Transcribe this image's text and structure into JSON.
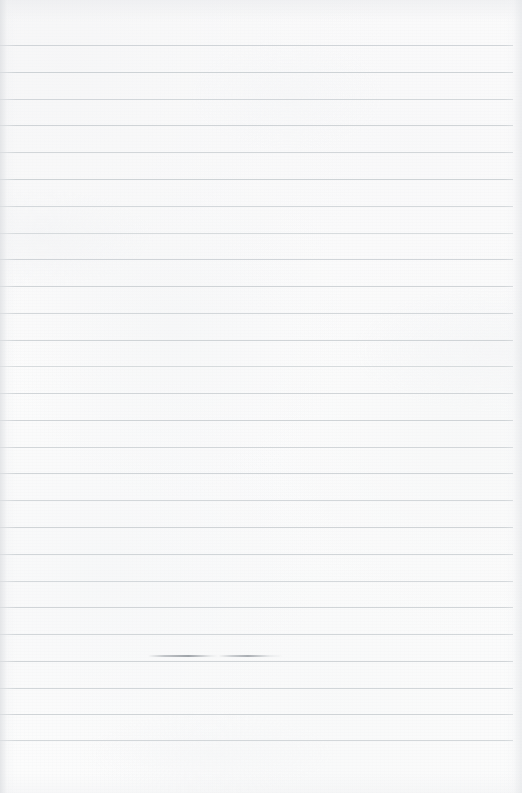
{
  "document": {
    "kind": "scanned-ruled-notebook-page",
    "page_width": 522,
    "page_height": 793,
    "background_color": "#fcfcfc",
    "text_content": "",
    "handwriting_present": false
  },
  "ruling": {
    "line_color": "#c9ced2",
    "line_thickness": 1,
    "line_count": 26,
    "first_line_y": 45,
    "line_spacing": 26.8,
    "line_start_x": 0,
    "line_end_x": 513,
    "top_margin": 45,
    "bottom_margin": 53,
    "vertical_margin_rule": false,
    "lines": [
      {
        "y": 45,
        "x1": 0,
        "x2": 513,
        "opacity": 0.85
      },
      {
        "y": 72,
        "x1": 0,
        "x2": 513,
        "opacity": 0.9
      },
      {
        "y": 99,
        "x1": 0,
        "x2": 513,
        "opacity": 0.8
      },
      {
        "y": 125,
        "x1": 0,
        "x2": 513,
        "opacity": 0.88
      },
      {
        "y": 152,
        "x1": 0,
        "x2": 513,
        "opacity": 0.82
      },
      {
        "y": 179,
        "x1": 0,
        "x2": 513,
        "opacity": 0.9
      },
      {
        "y": 206,
        "x1": 0,
        "x2": 513,
        "opacity": 0.78
      },
      {
        "y": 233,
        "x1": 0,
        "x2": 513,
        "opacity": 0.7
      },
      {
        "y": 259,
        "x1": 0,
        "x2": 513,
        "opacity": 0.85
      },
      {
        "y": 286,
        "x1": 0,
        "x2": 513,
        "opacity": 0.88
      },
      {
        "y": 313,
        "x1": 0,
        "x2": 513,
        "opacity": 0.8
      },
      {
        "y": 340,
        "x1": 0,
        "x2": 513,
        "opacity": 0.86
      },
      {
        "y": 366,
        "x1": 0,
        "x2": 513,
        "opacity": 0.7
      },
      {
        "y": 393,
        "x1": 0,
        "x2": 513,
        "opacity": 0.84
      },
      {
        "y": 420,
        "x1": 0,
        "x2": 513,
        "opacity": 0.88
      },
      {
        "y": 447,
        "x1": 0,
        "x2": 513,
        "opacity": 0.82
      },
      {
        "y": 473,
        "x1": 0,
        "x2": 513,
        "opacity": 0.86
      },
      {
        "y": 500,
        "x1": 0,
        "x2": 513,
        "opacity": 0.8
      },
      {
        "y": 527,
        "x1": 0,
        "x2": 513,
        "opacity": 0.88
      },
      {
        "y": 554,
        "x1": 0,
        "x2": 513,
        "opacity": 0.84
      },
      {
        "y": 581,
        "x1": 0,
        "x2": 513,
        "opacity": 0.78
      },
      {
        "y": 607,
        "x1": 0,
        "x2": 513,
        "opacity": 0.86
      },
      {
        "y": 634,
        "x1": 0,
        "x2": 513,
        "opacity": 0.82
      },
      {
        "y": 661,
        "x1": 0,
        "x2": 513,
        "opacity": 0.88
      },
      {
        "y": 688,
        "x1": 0,
        "x2": 513,
        "opacity": 0.84
      },
      {
        "y": 714,
        "x1": 0,
        "x2": 513,
        "opacity": 0.86
      },
      {
        "y": 740,
        "x1": 0,
        "x2": 513,
        "opacity": 0.8
      }
    ]
  },
  "artifacts": {
    "smudge": {
      "description": "darker pen-trace smudge along a ruled line",
      "y": 655,
      "x": 148,
      "width": 135
    }
  }
}
